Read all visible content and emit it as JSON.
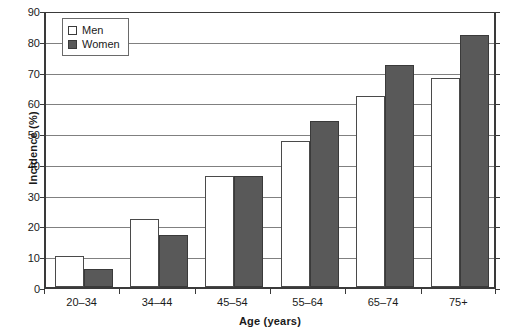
{
  "chart_data": {
    "type": "bar",
    "title": "",
    "xlabel": "Age (years)",
    "ylabel": "Incidence (%)",
    "categories": [
      "20–34",
      "34–44",
      "45–54",
      "55–64",
      "65–74",
      "75+"
    ],
    "series": [
      {
        "name": "Men",
        "color": "#ffffff",
        "values": [
          10,
          22,
          36,
          47.5,
          62,
          68
        ]
      },
      {
        "name": "Women",
        "color": "#595959",
        "values": [
          6,
          17,
          36,
          54,
          72,
          82
        ]
      }
    ],
    "ylim": [
      0,
      90
    ],
    "ytick_step": 10,
    "yticks": [
      0,
      10,
      20,
      30,
      40,
      50,
      60,
      70,
      80,
      90
    ],
    "ytick_labels": [
      "0",
      "10",
      "20",
      "30",
      "40",
      "50",
      "60",
      "70",
      "80",
      "90"
    ],
    "grid": true,
    "grid_axis": "y",
    "legend_position": "top-left",
    "legend_entries": [
      "Men",
      "Women"
    ]
  },
  "colors": {
    "men_fill": "#ffffff",
    "women_fill": "#595959",
    "frame": "#3a3a3a",
    "gridline": "#808080",
    "text": "#1a1a1a"
  }
}
